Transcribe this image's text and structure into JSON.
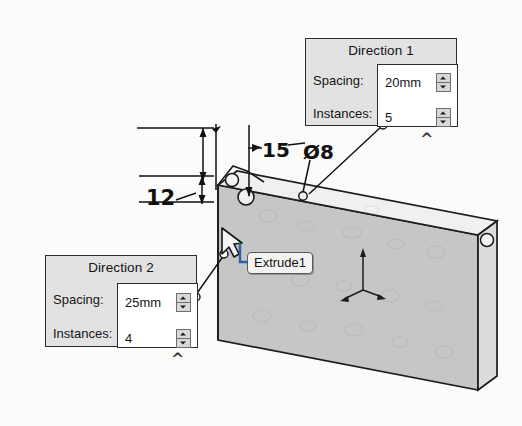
{
  "app": {
    "scene_description": "CAD 3D view of an extruded rectangular plate with a linear hole pattern",
    "background_color": "#fbfbfa"
  },
  "panels": [
    {
      "id": "direction-1",
      "title": "Direction 1",
      "rows": [
        {
          "label": "Spacing:",
          "value": "20mm",
          "spinner": true
        },
        {
          "label": "Instances:",
          "value": "5",
          "spinner": true
        }
      ],
      "collapse_chevron": "^"
    },
    {
      "id": "direction-2",
      "title": "Direction 2",
      "rows": [
        {
          "label": "Spacing:",
          "value": "25mm",
          "spinner": true
        },
        {
          "label": "Instances:",
          "value": "4",
          "spinner": true
        }
      ],
      "collapse_chevron": "^"
    }
  ],
  "tooltip": {
    "label": "Extrude1"
  },
  "dimensions": [
    {
      "id": "dim-12",
      "text": "12",
      "kind": "linear-vertical"
    },
    {
      "id": "dim-15",
      "text": "15",
      "kind": "linear-vertical"
    },
    {
      "id": "dim-dia",
      "text": "Ø8",
      "kind": "diameter"
    }
  ],
  "colors": {
    "panel_fill": "#e2e2e2",
    "panel_border": "#2c2c2c",
    "field_fill": "#ffffff",
    "model_face": "#c6c6c6",
    "model_top": "#efefef",
    "model_side": "#d6d6d6",
    "outline": "#1c1c1c",
    "tooltip_fill": "#f3f3f1"
  },
  "model": {
    "triad_axes": [
      "x",
      "y",
      "z"
    ],
    "feature_name": "Extrude1"
  }
}
